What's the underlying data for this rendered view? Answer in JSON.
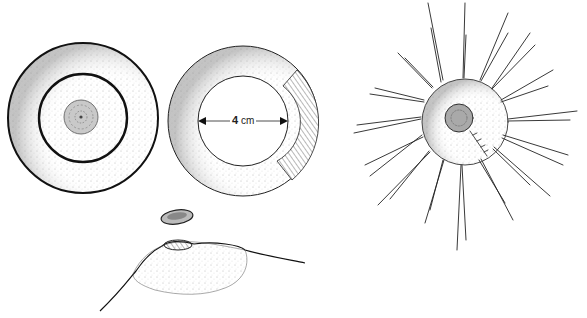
{
  "figure": {
    "panels": [
      {
        "id": "concentric-rings",
        "description": "Top view with outer ring and inner ring around central core"
      },
      {
        "id": "measured-ring",
        "description": "Top view with 4 cm inner diameter and hatched sector"
      },
      {
        "id": "radiating-spikes",
        "description": "Top view with radiating spikes and central core"
      },
      {
        "id": "side-profile",
        "description": "Side view of mound with detached cap"
      }
    ],
    "measurement": {
      "value": "4",
      "unit": "cm"
    }
  }
}
